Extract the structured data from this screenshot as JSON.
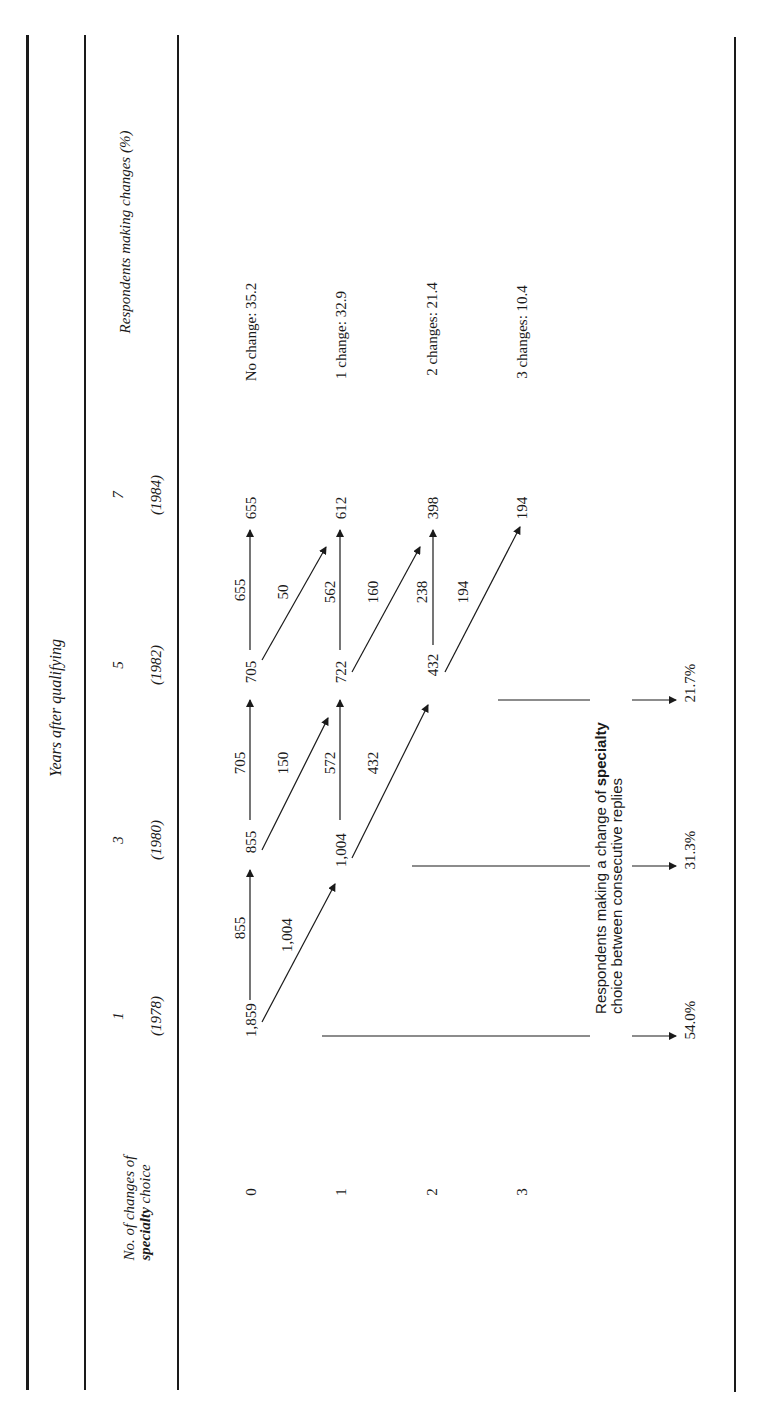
{
  "header": {
    "row_label_line1": "No. of changes of",
    "row_label_line2_bold": "specialty",
    "row_label_line2_rest": " choice",
    "group_title": "Years after qualifying",
    "outcome_title": "Respondents making changes (%)",
    "years": [
      {
        "year": "1",
        "calendar": "(1978)"
      },
      {
        "year": "3",
        "calendar": "(1980)"
      },
      {
        "year": "5",
        "calendar": "(1982)"
      },
      {
        "year": "7",
        "calendar": "(1984)"
      }
    ]
  },
  "rows": [
    {
      "changes": "0",
      "outcome": "No change: 35.2"
    },
    {
      "changes": "1",
      "outcome": "1 change: 32.9"
    },
    {
      "changes": "2",
      "outcome": "2 changes: 21.4"
    },
    {
      "changes": "3",
      "outcome": "3 changes: 10.4"
    }
  ],
  "nodes": {
    "y1_r0": "1,859",
    "y3_r0": "855",
    "y3_r1": "1,004",
    "y5_r0": "705",
    "y5_r1": "722",
    "y5_r2": "432",
    "y7_r0": "655",
    "y7_r1": "612",
    "y7_r2": "398",
    "y7_r3": "194"
  },
  "flows": {
    "f_1859_855": "855",
    "f_1859_1004": "1,004",
    "f_855_705": "705",
    "f_855_722": "150",
    "f_1004_722": "572",
    "f_1004_432": "432",
    "f_705_655": "655",
    "f_705_612": "50",
    "f_722_612": "562",
    "f_722_398": "160",
    "f_432_398": "238",
    "f_432_194": "194"
  },
  "summary": {
    "label_line1_pre": "Respondents making a change of ",
    "label_line1_bold": "specialty",
    "label_line2": "choice between consecutive replies",
    "pct_1978_1980": "54.0%",
    "pct_1980_1982": "31.3%",
    "pct_1982_1984": "21.7%"
  }
}
